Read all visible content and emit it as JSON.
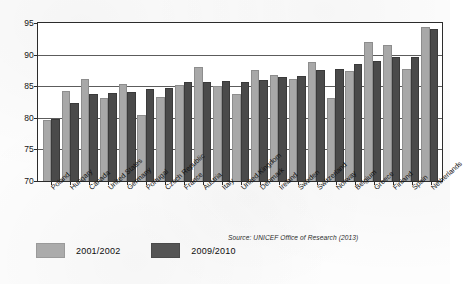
{
  "chart_data": {
    "type": "bar",
    "title": "",
    "subtitle": "",
    "xlabel": "",
    "ylabel": "",
    "ylim": [
      70,
      95
    ],
    "ytick_step": 5,
    "yticks": [
      70,
      75,
      80,
      85,
      90,
      95
    ],
    "grid": true,
    "legend_position": "bottom-left",
    "categories": [
      "Poland",
      "Hungary",
      "Canada",
      "United States",
      "Germany",
      "Portugal",
      "Czech Republic",
      "France",
      "Austria",
      "Italy",
      "United Kingdom",
      "Denmark",
      "Ireland",
      "Sweden",
      "Switzerland",
      "Norway",
      "Belgium",
      "Greece",
      "Finland",
      "Spain",
      "Netherlands"
    ],
    "series": [
      {
        "name": "2001/2002",
        "color": "#a8a8a8",
        "values": [
          79.7,
          84.3,
          86.2,
          83.1,
          85.3,
          80.4,
          83.3,
          85.2,
          88.0,
          85.1,
          83.7,
          87.6,
          86.7,
          86.1,
          88.9,
          83.1,
          87.4,
          92.0,
          91.5,
          87.8,
          94.3
        ]
      },
      {
        "name": "2009/2010",
        "color": "#4a4a4a",
        "values": [
          79.8,
          82.3,
          83.7,
          84.0,
          84.1,
          84.6,
          84.7,
          85.6,
          85.7,
          85.9,
          85.7,
          86.0,
          86.5,
          86.6,
          87.5,
          87.8,
          88.5,
          89.0,
          89.7,
          89.7,
          94.1
        ]
      }
    ],
    "source_note": "Source: UNICEF Office of Research (2013)"
  },
  "legend": {
    "items": [
      {
        "label": "2001/2002"
      },
      {
        "label": "2009/2010"
      }
    ]
  }
}
